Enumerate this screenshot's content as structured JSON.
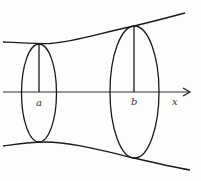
{
  "figure": {
    "colors": {
      "stroke": "#1a1a1a",
      "background": "#fdfdfc",
      "label": "#333333"
    },
    "labels": {
      "a": "a",
      "b": "b",
      "x": "x"
    }
  }
}
